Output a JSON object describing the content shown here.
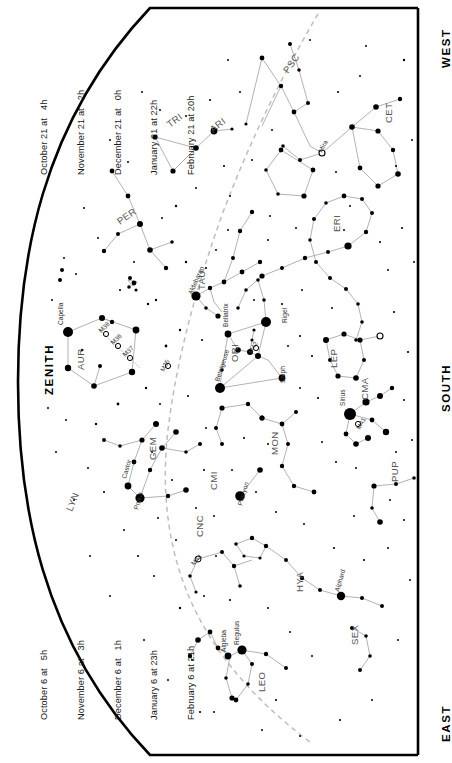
{
  "chart": {
    "orientation": "rotated-90",
    "cardinals": [
      {
        "name": "west",
        "label": "WEST"
      },
      {
        "name": "zenith",
        "label": "ZENITH"
      },
      {
        "name": "south",
        "label": "SOUTH"
      },
      {
        "name": "east",
        "label": "EAST"
      }
    ],
    "date_blocks": [
      {
        "name": "upper-date-block",
        "lines": [
          "October 21 at   4h",
          "November 21 at   2h",
          "December 21 at   0h",
          "January 21 at 22h",
          "February 21 at 20h"
        ]
      },
      {
        "name": "lower-date-block",
        "lines": [
          "October 6 at   5h",
          "November 6 at   3h",
          "December 6 at   1h",
          "January 6 at 23h",
          "February 6 at 21h"
        ]
      }
    ],
    "constellations": [
      {
        "abbr": "PSC",
        "x": 288,
        "y": 74,
        "rot": -55
      },
      {
        "abbr": "TRI",
        "x": 170,
        "y": 128,
        "rot": -38
      },
      {
        "abbr": "ARI",
        "x": 213,
        "y": 133,
        "rot": -38
      },
      {
        "abbr": "CET",
        "x": 392,
        "y": 123,
        "rot": 0
      },
      {
        "abbr": "PER",
        "x": 120,
        "y": 225,
        "rot": -35
      },
      {
        "abbr": "ERI",
        "x": 340,
        "y": 232,
        "rot": 0
      },
      {
        "abbr": "TAU",
        "x": 205,
        "y": 290,
        "rot": 0
      },
      {
        "abbr": "AUR",
        "x": 84,
        "y": 370,
        "rot": 0
      },
      {
        "abbr": "ORI",
        "x": 238,
        "y": 362,
        "rot": 0
      },
      {
        "abbr": "LEP",
        "x": 337,
        "y": 368,
        "rot": 0
      },
      {
        "abbr": "CMA",
        "x": 368,
        "y": 400,
        "rot": 0
      },
      {
        "abbr": "GEM",
        "x": 156,
        "y": 460,
        "rot": 0
      },
      {
        "abbr": "CMI",
        "x": 217,
        "y": 490,
        "rot": 0
      },
      {
        "abbr": "MON",
        "x": 278,
        "y": 455,
        "rot": 0
      },
      {
        "abbr": "PUP",
        "x": 398,
        "y": 482,
        "rot": 0
      },
      {
        "abbr": "LYN",
        "x": 72,
        "y": 512,
        "rot": 0
      },
      {
        "abbr": "CNC",
        "x": 203,
        "y": 537,
        "rot": 0
      },
      {
        "abbr": "HYA",
        "x": 303,
        "y": 592,
        "rot": 0
      },
      {
        "abbr": "SEX",
        "x": 358,
        "y": 645,
        "rot": 0
      },
      {
        "abbr": "LEO",
        "x": 265,
        "y": 692,
        "rot": 0
      }
    ],
    "stars_named": [
      {
        "name": "Mira",
        "x": 322,
        "y": 153
      },
      {
        "name": "Capella",
        "x": 63,
        "y": 325
      },
      {
        "name": "Aldebaran",
        "x": 192,
        "y": 295
      },
      {
        "name": "Bellatrix",
        "x": 228,
        "y": 327
      },
      {
        "name": "Betelgeuse",
        "x": 219,
        "y": 382
      },
      {
        "name": "Rigel",
        "x": 287,
        "y": 323
      },
      {
        "name": "Saiph",
        "x": 285,
        "y": 383
      },
      {
        "name": "Sirius",
        "x": 349,
        "y": 408
      },
      {
        "name": "Castor",
        "x": 128,
        "y": 479
      },
      {
        "name": "Pollux",
        "x": 140,
        "y": 508
      },
      {
        "name": "Procyon",
        "x": 240,
        "y": 504
      },
      {
        "name": "Alphard",
        "x": 341,
        "y": 592
      },
      {
        "name": "Regulus",
        "x": 241,
        "y": 643
      },
      {
        "name": "Algieba",
        "x": 228,
        "y": 650
      }
    ],
    "deep_sky": [
      {
        "name": "M38",
        "x": 108,
        "y": 336
      },
      {
        "name": "M36",
        "x": 120,
        "y": 347
      },
      {
        "name": "M37",
        "x": 131,
        "y": 360
      },
      {
        "name": "M35",
        "x": 169,
        "y": 367
      },
      {
        "name": "M42",
        "x": 256,
        "y": 346
      },
      {
        "name": "M41",
        "x": 357,
        "y": 424
      },
      {
        "name": "M44",
        "x": 198,
        "y": 559
      }
    ],
    "legend": {
      "ecliptic": "dashed line",
      "horizon": "solid arc"
    },
    "colors": {
      "background": "#ffffff",
      "ink": "#000000",
      "constellation_line": "#9a9a9a",
      "label": "#4a4a4a",
      "ecliptic": "#b9b9b9",
      "horizon": "#000000"
    }
  }
}
